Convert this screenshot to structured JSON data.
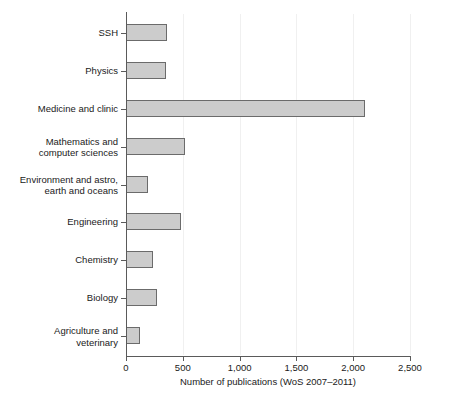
{
  "chart_data": {
    "type": "bar",
    "orientation": "horizontal",
    "title": "",
    "subtitle": "",
    "xlabel": "Number of publications (WoS 2007–2011)",
    "ylabel": "",
    "xlim": [
      0,
      2500
    ],
    "xticks": [
      0,
      500,
      1000,
      1500,
      2000,
      2500
    ],
    "xticklabels": [
      "0",
      "500",
      "1,000",
      "1,500",
      "2,000",
      "2,500"
    ],
    "grid": "vertical-faint",
    "legend": "none",
    "bar_color": "#cccccc",
    "bar_edge_color": "#6b6b6b",
    "axis_color": "#5a5a5a",
    "categories": [
      "SSH",
      "Physics",
      "Medicine and clinic",
      "Mathematics and\ncomputer sciences",
      "Environment and astro,\nearth and oceans",
      "Engineering",
      "Chemistry",
      "Biology",
      "Agriculture and\nveterinary"
    ],
    "category_lines": [
      [
        "SSH"
      ],
      [
        "Physics"
      ],
      [
        "Medicine and clinic"
      ],
      [
        "Mathematics and",
        "computer sciences"
      ],
      [
        "Environment and astro,",
        "earth and oceans"
      ],
      [
        "Engineering"
      ],
      [
        "Chemistry"
      ],
      [
        "Biology"
      ],
      [
        "Agriculture and",
        "veterinary"
      ]
    ],
    "values": [
      360,
      350,
      2100,
      520,
      195,
      485,
      235,
      270,
      120
    ]
  }
}
